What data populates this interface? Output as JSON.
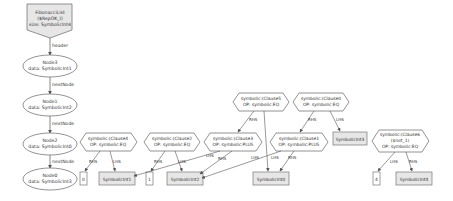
{
  "diagram": {
    "root": {
      "line1": "FibonacciList",
      "line2": "($RepOK_I)",
      "line3": "size: SymbolicInt4"
    },
    "edges": {
      "header": "header",
      "next1": "nextNode",
      "next2": "nextNode",
      "next3": "nextNode",
      "rhs": "RHS",
      "lhs": "LHS"
    },
    "nodes": [
      {
        "name": "Node3",
        "data": "data: SymbolicInt1"
      },
      {
        "name": "Node1",
        "data": "data: SymbolicInt2"
      },
      {
        "name": "Node2",
        "data": "data: SymbolicInt0"
      },
      {
        "name": "Node0",
        "data": "data: SymbolicInt3"
      }
    ],
    "clauses": {
      "c4": {
        "l1": "symbolic:(Clause4",
        "l2": "OP: symbolic:EQ"
      },
      "c2": {
        "l1": "symbolic:(Clause2",
        "l2": "OP: symbolic:EQ"
      },
      "c3": {
        "l1": "symbolic:(Clause3",
        "l2": "OP: symbolic:PLUS"
      },
      "c5": {
        "l1": "symbolic:(Clause5",
        "l2": "OP: symbolic:EQ"
      },
      "c0": {
        "l1": "symbolic:(Clause0",
        "l2": "OP: symbolic:EQ"
      },
      "c1": {
        "l1": "symbolic:(Clause1",
        "l2": "OP: symbolic:PLUS"
      },
      "c6": {
        "l1": "symbolic:(Clause6",
        "l2": "($not_1)",
        "l3": "OP: symbolic:EQ"
      }
    },
    "values": {
      "v0": "0",
      "v1": "1",
      "v4": "4",
      "s1": "SymbolicInt1",
      "s2": "SymbolicInt2",
      "s0": "SymbolicInt0",
      "s3": "SymbolicInt3",
      "s4": "SymbolicInt4"
    }
  }
}
